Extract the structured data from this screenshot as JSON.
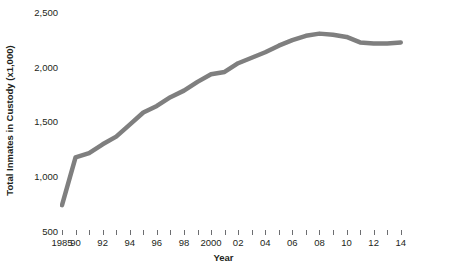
{
  "chart_data": {
    "type": "line",
    "title": "",
    "xlabel": "Year",
    "ylabel": "Total Inmates in Custody (x1,000)",
    "ylim": [
      500,
      2500
    ],
    "yticks": [
      500,
      1000,
      1500,
      2000,
      2500
    ],
    "ytick_labels": [
      "500",
      "1,000",
      "1,500",
      "2,000",
      "2,500"
    ],
    "grid": false,
    "legend": null,
    "line_color": "#7f7f7f",
    "line_width": 4.5,
    "x": [
      "1985",
      "1990",
      "1991",
      "1992",
      "1993",
      "1994",
      "1995",
      "1996",
      "1997",
      "1998",
      "1999",
      "2000",
      "2001",
      "2002",
      "2003",
      "2004",
      "2005",
      "2006",
      "2007",
      "2008",
      "2009",
      "2010",
      "2011",
      "2012",
      "2013",
      "2014"
    ],
    "xtick_labels": [
      "1985",
      "90",
      "",
      "92",
      "",
      "94",
      "",
      "96",
      "",
      "98",
      "",
      "2000",
      "",
      "02",
      "",
      "04",
      "",
      "06",
      "",
      "08",
      "",
      "10",
      "",
      "12",
      "",
      "14"
    ],
    "values": [
      745,
      1180,
      1220,
      1300,
      1370,
      1480,
      1590,
      1650,
      1730,
      1790,
      1870,
      1940,
      1960,
      2040,
      2090,
      2140,
      2200,
      2250,
      2290,
      2310,
      2300,
      2280,
      2230,
      2220,
      2220,
      2230
    ],
    "units": "thousands of inmates",
    "series_name": "Total Inmates in Custody"
  }
}
